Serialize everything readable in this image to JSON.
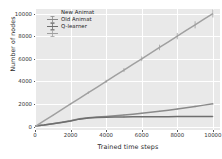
{
  "chart_data": {
    "type": "line",
    "title": "",
    "xlabel": "Trained time steps",
    "ylabel": "Number of nodes",
    "xlim": [
      0,
      10400
    ],
    "ylim": [
      -300,
      10400
    ],
    "xticks": [
      0,
      2000,
      4000,
      6000,
      8000,
      10000
    ],
    "xticklabels": [
      "0",
      "2000",
      "4000",
      "6000",
      "8000",
      "10000"
    ],
    "yticks": [
      0,
      2000,
      4000,
      6000,
      8000,
      10000
    ],
    "yticklabels": [
      "0",
      "2000",
      "4000",
      "6000",
      "8000",
      "10000"
    ],
    "grid": true,
    "grid_color": "#ffffff",
    "plot_background": "#e9e9e9",
    "legend_position": "upper left",
    "errorbars": true,
    "x": [
      0,
      500,
      1000,
      1500,
      2000,
      2500,
      3000,
      3500,
      4000,
      4500,
      5000,
      5500,
      6000,
      6500,
      7000,
      7500,
      8000,
      8500,
      9000,
      9500,
      10000
    ],
    "series": [
      {
        "name": "New Animat",
        "color": "#8a8a8a",
        "values": [
          60,
          150,
          260,
          380,
          520,
          700,
          790,
          850,
          900,
          960,
          1030,
          1100,
          1180,
          1260,
          1350,
          1450,
          1550,
          1660,
          1780,
          1900,
          2020
        ]
      },
      {
        "name": "Old Animat",
        "color": "#6e6e6e",
        "values": [
          55,
          140,
          250,
          370,
          500,
          660,
          770,
          810,
          830,
          845,
          855,
          862,
          868,
          873,
          878,
          882,
          886,
          890,
          893,
          896,
          900
        ]
      },
      {
        "name": "Q-learner",
        "color": "#a0a0a0",
        "values": [
          0,
          500,
          1000,
          1500,
          2000,
          2500,
          3000,
          3500,
          4000,
          4500,
          5000,
          5500,
          6000,
          6500,
          7000,
          7500,
          8000,
          8500,
          9000,
          9500,
          10000
        ]
      }
    ]
  },
  "legend": {
    "items": [
      {
        "label": "New Animat"
      },
      {
        "label": "Old Animat"
      },
      {
        "label": "Q-learner"
      }
    ]
  }
}
